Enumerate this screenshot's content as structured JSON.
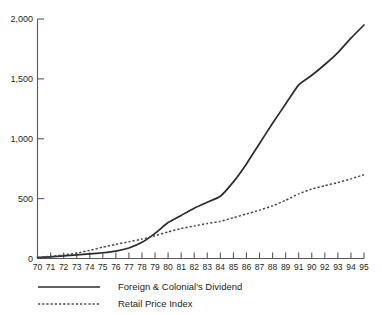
{
  "chart_data": {
    "type": "line",
    "title": "",
    "xlabel": "",
    "ylabel": "",
    "ylim": [
      0,
      2000
    ],
    "yticks": [
      0,
      500,
      1000,
      1500,
      2000
    ],
    "ytick_labels": [
      "0",
      "500",
      "1,000",
      "1,500",
      "2,000"
    ],
    "grid": false,
    "legend_position": "bottom-left",
    "categories": [
      "70",
      "71",
      "72",
      "73",
      "74",
      "75",
      "76",
      "77",
      "78",
      "79",
      "80",
      "81",
      "82",
      "83",
      "84",
      "85",
      "86",
      "87",
      "88",
      "89",
      "91",
      "90",
      "92",
      "93",
      "94",
      "95"
    ],
    "x": [
      1970,
      1971,
      1972,
      1973,
      1974,
      1975,
      1976,
      1977,
      1978,
      1979,
      1980,
      1981,
      1982,
      1983,
      1984,
      1985,
      1986,
      1987,
      1988,
      1989,
      1990,
      1991,
      1992,
      1993,
      1994,
      1995
    ],
    "series": [
      {
        "name": "Foreign & Colonial's Dividend",
        "style": "solid",
        "color": "#2b2b2b",
        "values": [
          8,
          14,
          22,
          30,
          38,
          48,
          62,
          88,
          135,
          210,
          300,
          360,
          420,
          470,
          520,
          640,
          790,
          960,
          1130,
          1290,
          1450,
          1530,
          1620,
          1720,
          1840,
          1950
        ]
      },
      {
        "name": "Retail Price Index",
        "style": "dashed",
        "color": "#4a4a4a",
        "values": [
          8,
          18,
          30,
          45,
          68,
          95,
          118,
          140,
          162,
          190,
          222,
          250,
          272,
          292,
          310,
          340,
          372,
          404,
          440,
          486,
          540,
          580,
          608,
          635,
          665,
          700
        ]
      }
    ],
    "legend": [
      {
        "label": "Foreign & Colonial's Dividend",
        "style": "solid"
      },
      {
        "label": "Retail Price Index",
        "style": "dashed"
      }
    ]
  }
}
